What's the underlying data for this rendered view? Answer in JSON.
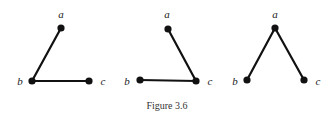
{
  "figure": {
    "caption": "Figure 3.6",
    "panels": [
      {
        "id": "panel-1",
        "nodes": [
          {
            "label": "a",
            "x": 61,
            "y": 28,
            "lx": 61,
            "ly": 18
          },
          {
            "label": "b",
            "x": 32,
            "y": 81,
            "lx": 20,
            "ly": 85
          },
          {
            "label": "c",
            "x": 89,
            "y": 81,
            "lx": 103,
            "ly": 85
          }
        ],
        "edges": [
          [
            "a",
            "b"
          ],
          [
            "b",
            "c"
          ]
        ]
      },
      {
        "id": "panel-2",
        "nodes": [
          {
            "label": "a",
            "x": 168,
            "y": 29,
            "lx": 167,
            "ly": 18
          },
          {
            "label": "b",
            "x": 140,
            "y": 80,
            "lx": 127,
            "ly": 85
          },
          {
            "label": "c",
            "x": 196,
            "y": 81,
            "lx": 210,
            "ly": 85
          }
        ],
        "edges": [
          [
            "a",
            "c"
          ],
          [
            "b",
            "c"
          ]
        ]
      },
      {
        "id": "panel-3",
        "nodes": [
          {
            "label": "a",
            "x": 275,
            "y": 28,
            "lx": 275,
            "ly": 18
          },
          {
            "label": "b",
            "x": 247,
            "y": 80,
            "lx": 235,
            "ly": 85
          },
          {
            "label": "c",
            "x": 304,
            "y": 80,
            "lx": 318,
            "ly": 85
          }
        ],
        "edges": [
          [
            "a",
            "b"
          ],
          [
            "a",
            "c"
          ]
        ]
      }
    ]
  }
}
